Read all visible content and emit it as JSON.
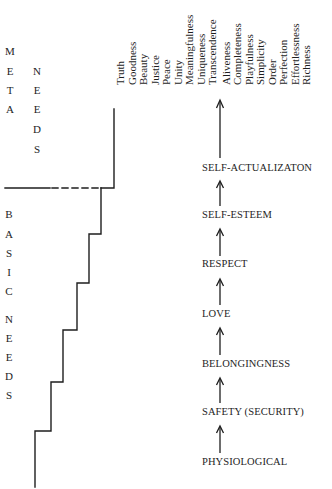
{
  "diagram": {
    "meta_needs_label": {
      "left_column": [
        "M",
        "E",
        "T",
        "A"
      ],
      "right_column": [
        "N",
        "E",
        "E",
        "D",
        "S"
      ]
    },
    "basic_needs_label": {
      "column": [
        "B",
        "A",
        "S",
        "I",
        "C",
        "",
        "N",
        "E",
        "E",
        "D",
        "S"
      ]
    },
    "meta_values": [
      "Truth",
      "Goodness",
      "Beauty",
      "Justice",
      "Peace",
      "Unity",
      "Meaningfulness",
      "Uniqueness",
      "Transcendence",
      "Aliveness",
      "Completeness",
      "Playfulness",
      "Simplicity",
      "Order",
      "Perfection",
      "Effortlessness",
      "Richness"
    ],
    "hierarchy_levels": [
      "SELF-ACTUALIZATON",
      "SELF-ESTEEM",
      "RESPECT",
      "LOVE",
      "BELONGINGNESS",
      "SAFETY (SECURITY)",
      "PHYSIOLOGICAL"
    ],
    "colors": {
      "ink": "#1e1e1e",
      "background": "#ffffff"
    }
  }
}
